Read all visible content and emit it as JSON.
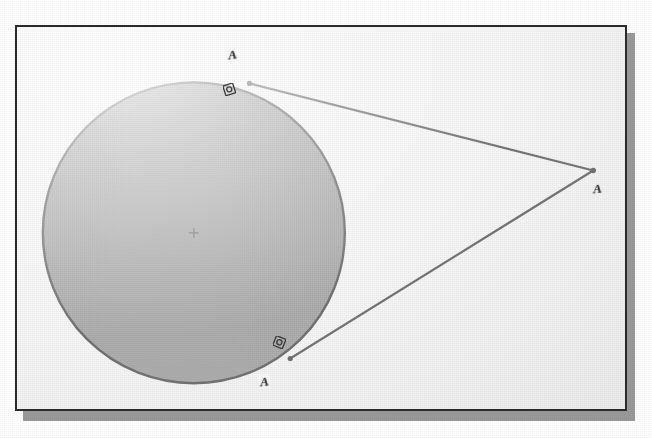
{
  "figure": {
    "frame": {
      "border_color": "#2b2b2b",
      "background_color": "#fbfbfb",
      "shadow_color": "#9a9a9a",
      "x": 15,
      "y": 25,
      "width": 612,
      "height": 386
    },
    "circle": {
      "center_label": "+",
      "center_x": 193,
      "center_y": 233,
      "radius": 152,
      "fill_color": "#8b8b8b",
      "stroke_color": "#2f2f2f",
      "stroke_width": 2.4
    },
    "external_point": {
      "label": "A",
      "x": 595,
      "y": 170,
      "marker": "dot"
    },
    "tangent_points": [
      {
        "label": "A",
        "x": 249,
        "y": 82,
        "perp_marker": "right-angle",
        "perp_marker_x": 228,
        "perp_marker_y": 88
      },
      {
        "label": "A",
        "x": 290,
        "y": 360,
        "perp_marker": "right-angle",
        "perp_marker_x": 277,
        "perp_marker_y": 340
      }
    ],
    "tangent_lines": [
      {
        "name": "upper-tangent",
        "x1": 249,
        "y1": 82,
        "x2": 595,
        "y2": 170
      },
      {
        "name": "lower-tangent",
        "x1": 290,
        "y1": 360,
        "x2": 595,
        "y2": 170
      }
    ],
    "line_color": "#333333",
    "line_width": 2.2
  },
  "labels": {
    "apex": "A",
    "upper_tangent": "A",
    "lower_tangent": "A",
    "center_cross": "+"
  }
}
